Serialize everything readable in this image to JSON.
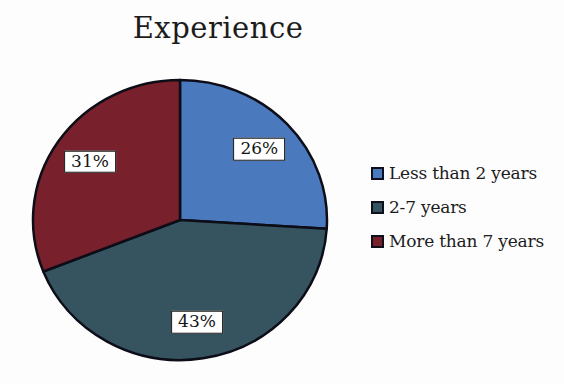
{
  "chart_data": {
    "type": "pie",
    "title": "Experience",
    "categories": [
      "Less than 2 years",
      "2-7 years",
      "More than 7 years"
    ],
    "values": [
      26,
      43,
      31
    ],
    "slices": [
      {
        "label": "Less than 2 years",
        "value": 26,
        "percent_label": "26%",
        "color": "#4A79BD"
      },
      {
        "label": "2-7 years",
        "value": 43,
        "percent_label": "43%",
        "color": "#355460"
      },
      {
        "label": "More than 7 years",
        "value": 31,
        "percent_label": "31%",
        "color": "#78202B"
      }
    ],
    "start_angle_deg": 0,
    "direction": "clockwise",
    "legend_position": "right",
    "slice_border_color": "#0D0D18",
    "label_box_bg": "#FFFFFF",
    "label_box_border": "#141414",
    "title_color": "#1C1C1C",
    "text_color": "#1C1C1C"
  }
}
